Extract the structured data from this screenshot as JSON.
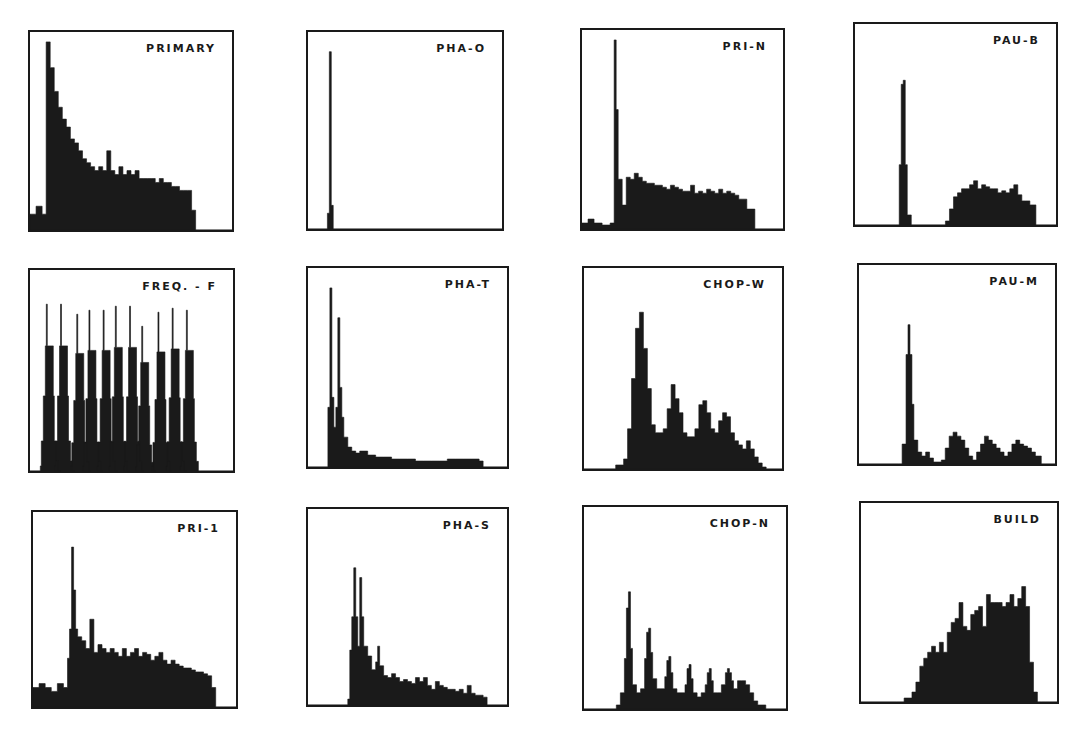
{
  "figure": {
    "background": "#ffffff",
    "ink": "#1a1a1a",
    "panels": [
      {
        "label": "PRIMARY",
        "box": [
          28,
          30,
          206,
          202
        ]
      },
      {
        "label": "PHA-O",
        "box": [
          306,
          30,
          198,
          201
        ]
      },
      {
        "label": "PRI-N",
        "box": [
          580,
          28,
          205,
          203
        ]
      },
      {
        "label": "PAU-B",
        "box": [
          853,
          22,
          205,
          205
        ]
      },
      {
        "label": "FREQ. - F",
        "box": [
          28,
          268,
          207,
          205
        ]
      },
      {
        "label": "PHA-T",
        "box": [
          306,
          266,
          203,
          203
        ]
      },
      {
        "label": "CHOP-W",
        "box": [
          582,
          266,
          202,
          205
        ]
      },
      {
        "label": "PAU-M",
        "box": [
          857,
          263,
          200,
          203
        ]
      },
      {
        "label": "PRI-1",
        "box": [
          31,
          510,
          207,
          199
        ]
      },
      {
        "label": "PHA-S",
        "box": [
          306,
          507,
          203,
          200
        ]
      },
      {
        "label": "CHOP-N",
        "box": [
          582,
          505,
          206,
          206
        ]
      },
      {
        "label": "BUILD",
        "box": [
          859,
          501,
          200,
          203
        ]
      }
    ]
  },
  "chart_data": [
    {
      "type": "bar",
      "title": "PRIMARY",
      "note": "histogram; heights as fraction of panel height; x as fraction of panel width",
      "x": [
        0.0,
        0.03,
        0.06,
        0.08,
        0.1,
        0.12,
        0.14,
        0.16,
        0.18,
        0.2,
        0.22,
        0.24,
        0.26,
        0.28,
        0.3,
        0.32,
        0.34,
        0.36,
        0.38,
        0.4,
        0.42,
        0.44,
        0.46,
        0.48,
        0.5,
        0.52,
        0.54,
        0.56,
        0.58,
        0.6,
        0.62,
        0.64,
        0.66,
        0.68,
        0.7,
        0.72,
        0.74,
        0.76,
        0.78,
        0.8,
        0.82
      ],
      "values": [
        0.08,
        0.12,
        0.08,
        0.95,
        0.82,
        0.7,
        0.62,
        0.56,
        0.52,
        0.46,
        0.44,
        0.4,
        0.36,
        0.34,
        0.32,
        0.3,
        0.32,
        0.3,
        0.4,
        0.3,
        0.28,
        0.32,
        0.28,
        0.3,
        0.28,
        0.3,
        0.26,
        0.26,
        0.26,
        0.26,
        0.24,
        0.26,
        0.24,
        0.24,
        0.22,
        0.22,
        0.2,
        0.2,
        0.2,
        0.1,
        0.0
      ]
    },
    {
      "type": "bar",
      "title": "PHA-O",
      "x": [
        0.0,
        0.1,
        0.11,
        0.12,
        0.13,
        0.14
      ],
      "values": [
        0.0,
        0.08,
        0.9,
        0.12,
        0.0,
        0.0
      ]
    },
    {
      "type": "bar",
      "title": "PRI-N",
      "x": [
        0.0,
        0.03,
        0.06,
        0.1,
        0.14,
        0.16,
        0.17,
        0.18,
        0.2,
        0.22,
        0.24,
        0.26,
        0.28,
        0.3,
        0.32,
        0.34,
        0.36,
        0.38,
        0.4,
        0.42,
        0.44,
        0.46,
        0.48,
        0.5,
        0.52,
        0.54,
        0.56,
        0.58,
        0.6,
        0.62,
        0.64,
        0.66,
        0.68,
        0.7,
        0.72,
        0.74,
        0.76,
        0.78,
        0.8,
        0.82,
        0.86,
        0.88
      ],
      "values": [
        0.03,
        0.05,
        0.03,
        0.02,
        0.03,
        0.95,
        0.6,
        0.25,
        0.12,
        0.26,
        0.25,
        0.28,
        0.26,
        0.24,
        0.23,
        0.23,
        0.22,
        0.22,
        0.21,
        0.2,
        0.22,
        0.21,
        0.2,
        0.19,
        0.19,
        0.22,
        0.18,
        0.19,
        0.18,
        0.2,
        0.19,
        0.18,
        0.2,
        0.18,
        0.19,
        0.18,
        0.17,
        0.15,
        0.15,
        0.1,
        0.0,
        0.0
      ]
    },
    {
      "type": "bar",
      "title": "PAU-B",
      "x": [
        0.0,
        0.2,
        0.22,
        0.23,
        0.24,
        0.25,
        0.26,
        0.28,
        0.45,
        0.47,
        0.49,
        0.51,
        0.53,
        0.55,
        0.57,
        0.59,
        0.61,
        0.63,
        0.65,
        0.67,
        0.69,
        0.71,
        0.73,
        0.75,
        0.77,
        0.79,
        0.81,
        0.83,
        0.85,
        0.87,
        0.9
      ],
      "values": [
        0.0,
        0.0,
        0.3,
        0.7,
        0.72,
        0.3,
        0.05,
        0.0,
        0.02,
        0.08,
        0.14,
        0.16,
        0.18,
        0.18,
        0.2,
        0.22,
        0.18,
        0.2,
        0.19,
        0.18,
        0.18,
        0.16,
        0.17,
        0.16,
        0.18,
        0.2,
        0.15,
        0.12,
        0.12,
        0.1,
        0.0
      ]
    },
    {
      "type": "bar",
      "title": "FREQ. - F",
      "note": "11 comb-like narrow peaks",
      "peaks_x": [
        0.1,
        0.17,
        0.25,
        0.31,
        0.38,
        0.44,
        0.51,
        0.57,
        0.65,
        0.72,
        0.79
      ],
      "peaks_height": [
        0.83,
        0.83,
        0.78,
        0.8,
        0.8,
        0.82,
        0.82,
        0.72,
        0.79,
        0.81,
        0.8
      ],
      "baseline_start": 0.05,
      "baseline_end": 0.86
    },
    {
      "type": "bar",
      "title": "PHA-T",
      "x": [
        0.0,
        0.09,
        0.1,
        0.11,
        0.12,
        0.13,
        0.14,
        0.15,
        0.16,
        0.17,
        0.18,
        0.2,
        0.22,
        0.24,
        0.26,
        0.3,
        0.34,
        0.38,
        0.42,
        0.46,
        0.5,
        0.54,
        0.58,
        0.62,
        0.66,
        0.7,
        0.74,
        0.78,
        0.82,
        0.86,
        0.88
      ],
      "values": [
        0.0,
        0.0,
        0.3,
        0.9,
        0.35,
        0.2,
        0.3,
        0.75,
        0.4,
        0.25,
        0.15,
        0.1,
        0.08,
        0.07,
        0.08,
        0.06,
        0.05,
        0.05,
        0.04,
        0.04,
        0.04,
        0.03,
        0.03,
        0.03,
        0.03,
        0.04,
        0.04,
        0.04,
        0.04,
        0.03,
        0.0
      ]
    },
    {
      "type": "bar",
      "title": "CHOP-W",
      "x": [
        0.0,
        0.16,
        0.2,
        0.22,
        0.24,
        0.26,
        0.28,
        0.3,
        0.32,
        0.34,
        0.36,
        0.38,
        0.4,
        0.42,
        0.44,
        0.46,
        0.48,
        0.5,
        0.52,
        0.54,
        0.56,
        0.58,
        0.6,
        0.62,
        0.64,
        0.66,
        0.68,
        0.7,
        0.72,
        0.74,
        0.76,
        0.78,
        0.8,
        0.82,
        0.84,
        0.86,
        0.88,
        0.9,
        0.92,
        0.96
      ],
      "values": [
        0.0,
        0.02,
        0.05,
        0.2,
        0.45,
        0.7,
        0.78,
        0.6,
        0.4,
        0.22,
        0.18,
        0.18,
        0.2,
        0.3,
        0.42,
        0.35,
        0.28,
        0.18,
        0.16,
        0.16,
        0.2,
        0.32,
        0.34,
        0.28,
        0.2,
        0.18,
        0.24,
        0.28,
        0.26,
        0.18,
        0.14,
        0.12,
        0.1,
        0.14,
        0.1,
        0.06,
        0.03,
        0.01,
        0.0,
        0.0
      ]
    },
    {
      "type": "bar",
      "title": "PAU-M",
      "x": [
        0.0,
        0.2,
        0.22,
        0.24,
        0.25,
        0.26,
        0.27,
        0.28,
        0.3,
        0.32,
        0.34,
        0.36,
        0.38,
        0.42,
        0.44,
        0.46,
        0.48,
        0.5,
        0.52,
        0.54,
        0.56,
        0.58,
        0.6,
        0.62,
        0.64,
        0.66,
        0.68,
        0.7,
        0.72,
        0.74,
        0.76,
        0.78,
        0.8,
        0.82,
        0.84,
        0.86,
        0.88,
        0.9,
        0.93
      ],
      "values": [
        0.0,
        0.0,
        0.1,
        0.55,
        0.7,
        0.55,
        0.3,
        0.12,
        0.06,
        0.04,
        0.06,
        0.03,
        0.01,
        0.02,
        0.08,
        0.14,
        0.16,
        0.14,
        0.12,
        0.08,
        0.04,
        0.02,
        0.06,
        0.1,
        0.14,
        0.12,
        0.1,
        0.08,
        0.06,
        0.04,
        0.06,
        0.1,
        0.12,
        0.1,
        0.09,
        0.08,
        0.06,
        0.04,
        0.0
      ]
    },
    {
      "type": "bar",
      "title": "PRI-1",
      "x": [
        0.0,
        0.03,
        0.06,
        0.09,
        0.12,
        0.15,
        0.17,
        0.18,
        0.19,
        0.2,
        0.21,
        0.22,
        0.24,
        0.26,
        0.28,
        0.3,
        0.32,
        0.34,
        0.36,
        0.38,
        0.4,
        0.42,
        0.44,
        0.46,
        0.48,
        0.5,
        0.52,
        0.54,
        0.56,
        0.58,
        0.6,
        0.62,
        0.64,
        0.66,
        0.68,
        0.7,
        0.72,
        0.74,
        0.76,
        0.78,
        0.8,
        0.82,
        0.84,
        0.86,
        0.88,
        0.9,
        0.92
      ],
      "values": [
        0.1,
        0.12,
        0.1,
        0.08,
        0.12,
        0.1,
        0.25,
        0.4,
        0.82,
        0.6,
        0.4,
        0.36,
        0.34,
        0.3,
        0.45,
        0.28,
        0.32,
        0.3,
        0.28,
        0.3,
        0.28,
        0.26,
        0.3,
        0.26,
        0.28,
        0.3,
        0.26,
        0.28,
        0.27,
        0.24,
        0.26,
        0.28,
        0.24,
        0.22,
        0.24,
        0.22,
        0.21,
        0.2,
        0.2,
        0.19,
        0.18,
        0.18,
        0.17,
        0.16,
        0.1,
        0.0,
        0.0
      ]
    },
    {
      "type": "bar",
      "title": "PHA-S",
      "x": [
        0.0,
        0.2,
        0.21,
        0.22,
        0.23,
        0.24,
        0.25,
        0.26,
        0.27,
        0.28,
        0.3,
        0.32,
        0.34,
        0.35,
        0.36,
        0.38,
        0.4,
        0.42,
        0.44,
        0.46,
        0.48,
        0.5,
        0.52,
        0.54,
        0.56,
        0.58,
        0.6,
        0.62,
        0.64,
        0.66,
        0.68,
        0.7,
        0.72,
        0.74,
        0.76,
        0.78,
        0.8,
        0.82,
        0.84,
        0.86,
        0.88,
        0.9
      ],
      "values": [
        0.0,
        0.03,
        0.28,
        0.45,
        0.7,
        0.45,
        0.3,
        0.65,
        0.45,
        0.3,
        0.25,
        0.18,
        0.22,
        0.3,
        0.2,
        0.15,
        0.14,
        0.16,
        0.14,
        0.12,
        0.13,
        0.12,
        0.11,
        0.14,
        0.12,
        0.14,
        0.1,
        0.08,
        0.12,
        0.1,
        0.09,
        0.08,
        0.08,
        0.07,
        0.08,
        0.06,
        0.1,
        0.06,
        0.05,
        0.05,
        0.04,
        0.0
      ]
    },
    {
      "type": "bar",
      "title": "CHOP-N",
      "x": [
        0.0,
        0.16,
        0.18,
        0.2,
        0.21,
        0.22,
        0.23,
        0.24,
        0.26,
        0.28,
        0.3,
        0.31,
        0.32,
        0.33,
        0.34,
        0.36,
        0.38,
        0.4,
        0.41,
        0.42,
        0.43,
        0.44,
        0.46,
        0.48,
        0.5,
        0.51,
        0.52,
        0.53,
        0.54,
        0.56,
        0.58,
        0.6,
        0.61,
        0.62,
        0.63,
        0.64,
        0.66,
        0.68,
        0.7,
        0.71,
        0.72,
        0.73,
        0.74,
        0.76,
        0.78,
        0.8,
        0.82,
        0.84,
        0.86,
        0.9
      ],
      "values": [
        0.0,
        0.02,
        0.08,
        0.25,
        0.5,
        0.58,
        0.3,
        0.12,
        0.08,
        0.1,
        0.25,
        0.38,
        0.4,
        0.28,
        0.15,
        0.1,
        0.1,
        0.16,
        0.24,
        0.26,
        0.18,
        0.1,
        0.08,
        0.08,
        0.12,
        0.2,
        0.22,
        0.15,
        0.08,
        0.06,
        0.08,
        0.12,
        0.18,
        0.2,
        0.14,
        0.08,
        0.08,
        0.12,
        0.18,
        0.2,
        0.18,
        0.14,
        0.1,
        0.14,
        0.14,
        0.12,
        0.08,
        0.04,
        0.02,
        0.0
      ]
    },
    {
      "type": "bar",
      "title": "BUILD",
      "x": [
        0.0,
        0.18,
        0.22,
        0.26,
        0.28,
        0.3,
        0.32,
        0.34,
        0.36,
        0.38,
        0.4,
        0.42,
        0.44,
        0.46,
        0.48,
        0.5,
        0.52,
        0.54,
        0.56,
        0.58,
        0.6,
        0.62,
        0.64,
        0.66,
        0.68,
        0.7,
        0.72,
        0.74,
        0.76,
        0.78,
        0.8,
        0.82,
        0.84,
        0.86,
        0.88,
        0.9,
        0.92,
        0.94
      ],
      "values": [
        0.0,
        0.0,
        0.02,
        0.05,
        0.1,
        0.18,
        0.22,
        0.25,
        0.28,
        0.25,
        0.3,
        0.25,
        0.35,
        0.4,
        0.42,
        0.5,
        0.38,
        0.36,
        0.44,
        0.46,
        0.48,
        0.38,
        0.54,
        0.5,
        0.5,
        0.5,
        0.48,
        0.5,
        0.54,
        0.48,
        0.52,
        0.58,
        0.48,
        0.2,
        0.05,
        0.0,
        0.0,
        0.0
      ]
    }
  ]
}
